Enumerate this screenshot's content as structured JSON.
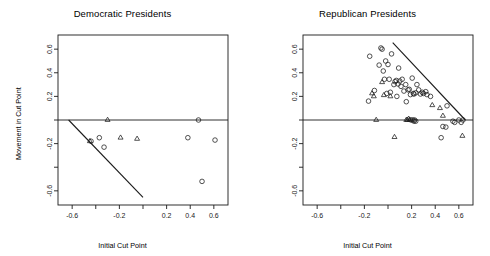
{
  "figure": {
    "width": 490,
    "height": 256,
    "background": "#ffffff",
    "foreground": "#1a1a1a"
  },
  "chart_data": [
    {
      "type": "scatter",
      "title": "Democratic Presidents",
      "xlabel": "Initial Cut Point",
      "ylabel": "Movement in Cut Point",
      "xlim": [
        -0.72,
        0.72
      ],
      "ylim": [
        -0.72,
        0.72
      ],
      "grid": false,
      "legend": "none",
      "xticks": [
        -0.6,
        -0.4,
        -0.2,
        0,
        0.2,
        0.4,
        0.6
      ],
      "xticklabels": [
        "-0.6",
        "",
        "-0.2",
        "",
        "0.2",
        "0.4",
        "0.6"
      ],
      "yticks": [
        -0.6,
        -0.4,
        -0.2,
        0,
        0.2,
        0.4,
        0.6
      ],
      "yticklabels": [
        "-0.6",
        "",
        "-0.2",
        "",
        "0.2",
        "0.4",
        "0.6"
      ],
      "annotations": [
        {
          "name": "zero-reference-line",
          "kind": "horizontal-line",
          "y": 0,
          "x_from": -0.72,
          "x_to": 0.72
        },
        {
          "name": "constraint-boundary-line",
          "kind": "segment",
          "x_from": -0.63,
          "y_from": 0.0,
          "x_to": 0.0,
          "y_to": -0.655
        }
      ],
      "series": [
        {
          "name": "circles",
          "marker": "circle",
          "points": [
            [
              -0.44,
              -0.18
            ],
            [
              -0.37,
              -0.15
            ],
            [
              -0.33,
              -0.23
            ],
            [
              0.38,
              -0.15
            ],
            [
              0.47,
              0.0
            ],
            [
              0.5,
              -0.52
            ],
            [
              0.61,
              -0.17
            ]
          ]
        },
        {
          "name": "triangles",
          "marker": "triangle",
          "points": [
            [
              -0.45,
              -0.18
            ],
            [
              -0.3,
              0.0
            ],
            [
              -0.19,
              -0.15
            ],
            [
              -0.05,
              -0.16
            ]
          ]
        }
      ]
    },
    {
      "type": "scatter",
      "title": "Republican Presidents",
      "xlabel": "Initial Cut Point",
      "ylabel": "Movement in Cut Point",
      "xlim": [
        -0.72,
        0.72
      ],
      "ylim": [
        -0.72,
        0.72
      ],
      "grid": false,
      "legend": "none",
      "xticks": [
        -0.6,
        -0.4,
        -0.2,
        0,
        0.2,
        0.4,
        0.6
      ],
      "xticklabels": [
        "-0.6",
        "",
        "-0.2",
        "",
        "0.2",
        "0.4",
        "0.6"
      ],
      "yticks": [
        -0.6,
        -0.4,
        -0.2,
        0,
        0.2,
        0.4,
        0.6
      ],
      "yticklabels": [
        "-0.6",
        "",
        "-0.2",
        "",
        "0.2",
        "0.4",
        "0.6"
      ],
      "annotations": [
        {
          "name": "zero-reference-line",
          "kind": "horizontal-line",
          "y": 0,
          "x_from": -0.72,
          "x_to": 0.72
        },
        {
          "name": "constraint-boundary-line",
          "kind": "segment",
          "x_from": 0.04,
          "y_from": 0.655,
          "x_to": 0.655,
          "y_to": 0.0
        }
      ],
      "series": [
        {
          "name": "circles",
          "marker": "circle",
          "points": [
            [
              -0.155,
              0.54
            ],
            [
              -0.165,
              0.16
            ],
            [
              -0.115,
              0.25
            ],
            [
              -0.075,
              0.465
            ],
            [
              -0.06,
              0.61
            ],
            [
              -0.05,
              0.6
            ],
            [
              -0.04,
              0.415
            ],
            [
              -0.03,
              0.345
            ],
            [
              -0.02,
              0.5
            ],
            [
              -0.01,
              0.225
            ],
            [
              0.0,
              0.47
            ],
            [
              0.01,
              0.345
            ],
            [
              0.02,
              0.235
            ],
            [
              0.03,
              0.56
            ],
            [
              0.05,
              0.3
            ],
            [
              0.06,
              0.325
            ],
            [
              0.07,
              0.335
            ],
            [
              0.075,
              0.2
            ],
            [
              0.085,
              0.305
            ],
            [
              0.09,
              0.44
            ],
            [
              0.1,
              0.33
            ],
            [
              0.11,
              0.285
            ],
            [
              0.12,
              0.345
            ],
            [
              0.135,
              0.245
            ],
            [
              0.15,
              0.3
            ],
            [
              0.155,
              0.155
            ],
            [
              0.17,
              0.255
            ],
            [
              0.18,
              0.26
            ],
            [
              0.19,
              0.215
            ],
            [
              0.205,
              0.355
            ],
            [
              0.215,
              0.225
            ],
            [
              0.22,
              0.22
            ],
            [
              0.235,
              0.23
            ],
            [
              0.245,
              0.3
            ],
            [
              0.26,
              0.255
            ],
            [
              0.275,
              0.22
            ],
            [
              0.29,
              0.235
            ],
            [
              0.3,
              0.225
            ],
            [
              0.32,
              0.24
            ],
            [
              0.33,
              0.215
            ],
            [
              0.36,
              0.2
            ],
            [
              0.195,
              0.0
            ],
            [
              0.21,
              0.0
            ],
            [
              0.22,
              -0.01
            ],
            [
              0.225,
              0.0
            ],
            [
              0.235,
              -0.01
            ],
            [
              0.45,
              -0.15
            ],
            [
              0.465,
              -0.055
            ],
            [
              0.49,
              -0.06
            ],
            [
              0.5,
              0.12
            ],
            [
              0.55,
              -0.01
            ],
            [
              0.565,
              -0.02
            ],
            [
              0.6,
              0.0
            ],
            [
              0.62,
              -0.02
            ],
            [
              0.635,
              0.0
            ]
          ]
        },
        {
          "name": "triangles",
          "marker": "triangle",
          "points": [
            [
              -0.135,
              0.225
            ],
            [
              -0.12,
              0.2
            ],
            [
              -0.05,
              0.32
            ],
            [
              -0.035,
              0.21
            ],
            [
              0.02,
              0.2
            ],
            [
              -0.1,
              0.0
            ],
            [
              0.155,
              0.0
            ],
            [
              0.165,
              0.0
            ],
            [
              0.175,
              0.01
            ],
            [
              0.185,
              0.0
            ],
            [
              0.375,
              0.125
            ],
            [
              0.44,
              0.1
            ],
            [
              0.465,
              0.035
            ],
            [
              0.63,
              -0.135
            ],
            [
              0.055,
              -0.145
            ]
          ]
        }
      ]
    }
  ]
}
